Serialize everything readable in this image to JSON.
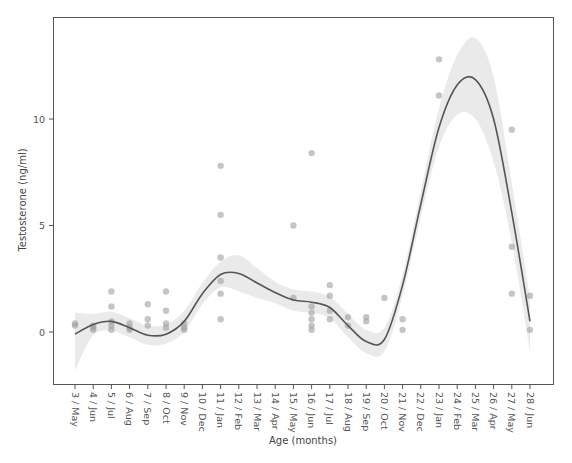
{
  "chart_data": {
    "type": "scatter",
    "title": "",
    "xlabel": "Age (months)",
    "ylabel": "Testosterone (ng/ml)",
    "ylim": [
      -2.45,
      14.8
    ],
    "yticks": [
      0,
      5,
      10
    ],
    "grid": false,
    "legend": null,
    "categories": [
      "3 / May",
      "4 / Jun",
      "5 / Jul",
      "6 / Aug",
      "7 / Sep",
      "8 / Oct",
      "9 / Nov",
      "10 / Dec",
      "11 / Jan",
      "12 / Feb",
      "13 / Mar",
      "14 / Apr",
      "15 / May",
      "16 / Jun",
      "17 / Jul",
      "18 / Aug",
      "19 / Sep",
      "20 / Oct",
      "21 / Nov",
      "22 / Dec",
      "23 / Jan",
      "24 / Feb",
      "25 / Mar",
      "26 / Apr",
      "27 / May",
      "28 / Jun"
    ],
    "points": [
      {
        "x": 3,
        "y": 0.4
      },
      {
        "x": 3,
        "y": 0.3
      },
      {
        "x": 4,
        "y": 0.2
      },
      {
        "x": 4,
        "y": 0.1
      },
      {
        "x": 4,
        "y": 0.3
      },
      {
        "x": 5,
        "y": 1.9
      },
      {
        "x": 5,
        "y": 1.2
      },
      {
        "x": 5,
        "y": 0.5
      },
      {
        "x": 5,
        "y": 0.3
      },
      {
        "x": 5,
        "y": 0.1
      },
      {
        "x": 6,
        "y": 0.4
      },
      {
        "x": 6,
        "y": 0.2
      },
      {
        "x": 6,
        "y": 0.1
      },
      {
        "x": 7,
        "y": 1.3
      },
      {
        "x": 7,
        "y": 0.6
      },
      {
        "x": 7,
        "y": 0.3
      },
      {
        "x": 8,
        "y": 1.9
      },
      {
        "x": 8,
        "y": 1.0
      },
      {
        "x": 8,
        "y": 0.4
      },
      {
        "x": 8,
        "y": 0.2
      },
      {
        "x": 9,
        "y": 0.4
      },
      {
        "x": 9,
        "y": 0.2
      },
      {
        "x": 9,
        "y": 0.1
      },
      {
        "x": 11,
        "y": 7.8
      },
      {
        "x": 11,
        "y": 5.5
      },
      {
        "x": 11,
        "y": 3.5
      },
      {
        "x": 11,
        "y": 2.4
      },
      {
        "x": 11,
        "y": 1.8
      },
      {
        "x": 11,
        "y": 0.6
      },
      {
        "x": 15,
        "y": 5.0
      },
      {
        "x": 15,
        "y": 1.6
      },
      {
        "x": 16,
        "y": 8.4
      },
      {
        "x": 16,
        "y": 1.2
      },
      {
        "x": 16,
        "y": 0.9
      },
      {
        "x": 16,
        "y": 0.6
      },
      {
        "x": 16,
        "y": 0.3
      },
      {
        "x": 16,
        "y": 0.1
      },
      {
        "x": 17,
        "y": 2.2
      },
      {
        "x": 17,
        "y": 1.7
      },
      {
        "x": 17,
        "y": 1.0
      },
      {
        "x": 17,
        "y": 0.6
      },
      {
        "x": 18,
        "y": 0.7
      },
      {
        "x": 18,
        "y": 0.3
      },
      {
        "x": 19,
        "y": 0.7
      },
      {
        "x": 19,
        "y": 0.5
      },
      {
        "x": 20,
        "y": 1.6
      },
      {
        "x": 21,
        "y": 0.6
      },
      {
        "x": 21,
        "y": 0.1
      },
      {
        "x": 23,
        "y": 12.8
      },
      {
        "x": 23,
        "y": 11.1
      },
      {
        "x": 27,
        "y": 9.5
      },
      {
        "x": 27,
        "y": 4.0
      },
      {
        "x": 27,
        "y": 1.8
      },
      {
        "x": 28,
        "y": 1.7
      },
      {
        "x": 28,
        "y": 0.1
      }
    ],
    "smooth_line": {
      "x": [
        3,
        4,
        5,
        6,
        7,
        8,
        9,
        10,
        11,
        12,
        13,
        14,
        15,
        16,
        17,
        18,
        19,
        20,
        21,
        22,
        23,
        24,
        25,
        26,
        27,
        28
      ],
      "y": [
        -0.1,
        0.35,
        0.5,
        0.2,
        -0.15,
        -0.1,
        0.5,
        1.8,
        2.7,
        2.75,
        2.3,
        1.85,
        1.5,
        1.4,
        1.15,
        0.3,
        -0.45,
        -0.35,
        2.2,
        6.0,
        9.6,
        11.6,
        11.85,
        10.0,
        5.6,
        0.5
      ]
    },
    "ci_band": {
      "upper": [
        0.9,
        0.85,
        0.95,
        0.65,
        0.3,
        0.35,
        1.0,
        2.3,
        3.3,
        3.6,
        3.0,
        2.35,
        2.0,
        1.9,
        1.65,
        0.85,
        0.1,
        0.2,
        2.7,
        6.6,
        10.5,
        13.0,
        13.8,
        12.0,
        7.0,
        1.6
      ],
      "lower": [
        -1.8,
        -0.15,
        0.05,
        -0.25,
        -0.6,
        -0.55,
        0.0,
        1.3,
        2.1,
        1.9,
        1.6,
        1.35,
        1.0,
        0.9,
        0.65,
        -0.25,
        -1.0,
        -0.9,
        1.7,
        5.4,
        8.7,
        10.2,
        10.0,
        8.0,
        4.2,
        -0.9
      ]
    }
  }
}
